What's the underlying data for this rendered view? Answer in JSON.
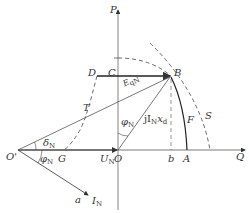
{
  "diagram": {
    "type": "phasor-diagram",
    "axes": {
      "vertical": "P",
      "horizontal": "Q"
    },
    "points": {
      "P": "P",
      "Q": "Q",
      "O": "O",
      "O_prime": "O'",
      "B": "B",
      "C": "C",
      "D": "D",
      "T": "T",
      "G": "G",
      "b": "b",
      "A": "A",
      "F": "F",
      "S": "S",
      "a": "a"
    },
    "vectors": {
      "E": "E",
      "E_sub": "qN",
      "jIx_prefix": "jI",
      "jIx_sub": "N",
      "jIx_x": "x",
      "jIx_xsub": "d",
      "U": "U",
      "U_sub": "N",
      "I": "I",
      "I_sub": "N"
    },
    "angles": {
      "phi": "φ",
      "phi_sub": "N",
      "delta": "δ",
      "delta_sub": "N"
    },
    "colors": {
      "line": "#333333",
      "thin": "#555555",
      "background": "#ffffff"
    }
  }
}
